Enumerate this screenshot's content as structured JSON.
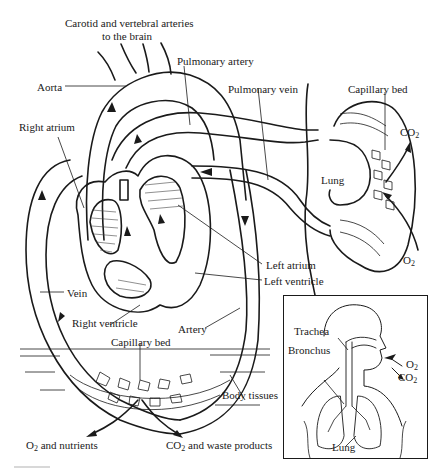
{
  "diagram": {
    "labels": {
      "carotid": "Carotid and vertebral arteries",
      "carotid_line2": "to the brain",
      "pulmonary_artery": "Pulmonary artery",
      "aorta": "Aorta",
      "pulmonary_vein": "Pulmonary vein",
      "capillary_bed_lung": "Capillary bed",
      "right_atrium": "Right atrium",
      "co2_lung": "CO",
      "co2_lung_sub": "2",
      "lung": "Lung",
      "o2_lung": "O",
      "o2_lung_sub": "2",
      "left_atrium": "Left atrium",
      "left_ventricle": "Left ventricle",
      "vein": "Vein",
      "right_ventricle": "Right ventricle",
      "artery": "Artery",
      "capillary_bed_body": "Capillary bed",
      "body_tissues": "Body tissues",
      "o2_nutrients_o": "O",
      "o2_nutrients_sub": "2",
      "o2_nutrients_rest": " and nutrients",
      "co2_waste_co": "CO",
      "co2_waste_sub": "2",
      "co2_waste_rest": " and waste products"
    },
    "inset": {
      "trachea": "Trachea",
      "bronchus": "Bronchus",
      "o2": "O",
      "o2_sub": "2",
      "co2": "CO",
      "co2_sub": "2",
      "lung": "Lung"
    }
  }
}
